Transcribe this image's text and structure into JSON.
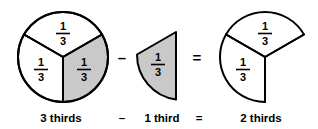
{
  "figure": {
    "colors": {
      "background": "#ffffff",
      "outline": "#000000",
      "shaded_fill": "#c9c9c9",
      "unshaded_fill": "#ffffff"
    },
    "numerator": "1",
    "denominator": "3",
    "fraction_label": "1/3"
  },
  "shapes": {
    "minuend": {
      "name": "whole-circle-three-thirds",
      "total_parts": 3,
      "shaded_parts": 1,
      "sectors": [
        {
          "id": "top",
          "label_numerator": "1",
          "label_denominator": "3",
          "shaded": false
        },
        {
          "id": "left",
          "label_numerator": "1",
          "label_denominator": "3",
          "shaded": false
        },
        {
          "id": "right",
          "label_numerator": "1",
          "label_denominator": "3",
          "shaded": true
        }
      ]
    },
    "subtrahend": {
      "name": "single-third-wedge",
      "total_parts": 1,
      "shaded_parts": 1,
      "sectors": [
        {
          "id": "wedge",
          "label_numerator": "1",
          "label_denominator": "3",
          "shaded": true
        }
      ]
    },
    "result": {
      "name": "circle-two-thirds",
      "total_parts": 2,
      "shaded_parts": 0,
      "sectors": [
        {
          "id": "top",
          "label_numerator": "1",
          "label_denominator": "3",
          "shaded": false
        },
        {
          "id": "left",
          "label_numerator": "1",
          "label_denominator": "3",
          "shaded": false
        }
      ]
    }
  },
  "operators": {
    "minus": "–",
    "equals": "="
  },
  "caption": {
    "minuend": "3 thirds",
    "minus": "–",
    "subtrahend": "1 third",
    "equals": "=",
    "result": "2 thirds"
  }
}
